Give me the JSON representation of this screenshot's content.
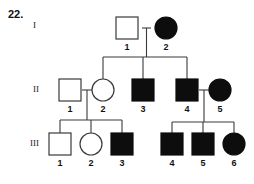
{
  "question": {
    "number": "22."
  },
  "chart_data": {
    "type": "diagram",
    "diagram_kind": "pedigree",
    "legend": {
      "open_square": "unaffected male",
      "filled_square": "affected male",
      "open_circle": "unaffected female",
      "filled_circle": "affected female"
    },
    "generations": [
      {
        "label": "I",
        "individuals": [
          {
            "id": "1",
            "sex": "male",
            "shape": "square",
            "affected": false,
            "x": 127,
            "y": 28
          },
          {
            "id": "2",
            "sex": "female",
            "shape": "circle",
            "affected": true,
            "x": 166,
            "y": 28
          }
        ]
      },
      {
        "label": "II",
        "individuals": [
          {
            "id": "1",
            "sex": "male",
            "shape": "square",
            "affected": false,
            "x": 70,
            "y": 90
          },
          {
            "id": "2",
            "sex": "female",
            "shape": "circle",
            "affected": false,
            "x": 103,
            "y": 90
          },
          {
            "id": "3",
            "sex": "male",
            "shape": "square",
            "affected": true,
            "x": 143,
            "y": 90
          },
          {
            "id": "4",
            "sex": "male",
            "shape": "square",
            "affected": true,
            "x": 187,
            "y": 90
          },
          {
            "id": "5",
            "sex": "female",
            "shape": "circle",
            "affected": true,
            "x": 220,
            "y": 90
          }
        ]
      },
      {
        "label": "III",
        "individuals": [
          {
            "id": "1",
            "sex": "male",
            "shape": "square",
            "affected": false,
            "x": 60,
            "y": 144
          },
          {
            "id": "2",
            "sex": "female",
            "shape": "circle",
            "affected": false,
            "x": 91,
            "y": 144
          },
          {
            "id": "3",
            "sex": "male",
            "shape": "square",
            "affected": true,
            "x": 122,
            "y": 144
          },
          {
            "id": "4",
            "sex": "male",
            "shape": "square",
            "affected": true,
            "x": 172,
            "y": 144
          },
          {
            "id": "5",
            "sex": "male",
            "shape": "square",
            "affected": true,
            "x": 203,
            "y": 144
          },
          {
            "id": "6",
            "sex": "female",
            "shape": "circle",
            "affected": true,
            "x": 234,
            "y": 144
          }
        ]
      }
    ],
    "matings": [
      {
        "parents": [
          "I-1",
          "I-2"
        ],
        "children": [
          "II-2",
          "II-3",
          "II-4"
        ]
      },
      {
        "parents": [
          "II-1",
          "II-2"
        ],
        "children": [
          "III-1",
          "III-2",
          "III-3"
        ]
      },
      {
        "parents": [
          "II-4",
          "II-5"
        ],
        "children": [
          "III-4",
          "III-5",
          "III-6"
        ]
      }
    ],
    "colors": {
      "affected_fill": "#0d0d0d",
      "unaffected_fill": "#ffffff",
      "stroke": "#3a3a3a",
      "background": "#ffffff"
    }
  }
}
